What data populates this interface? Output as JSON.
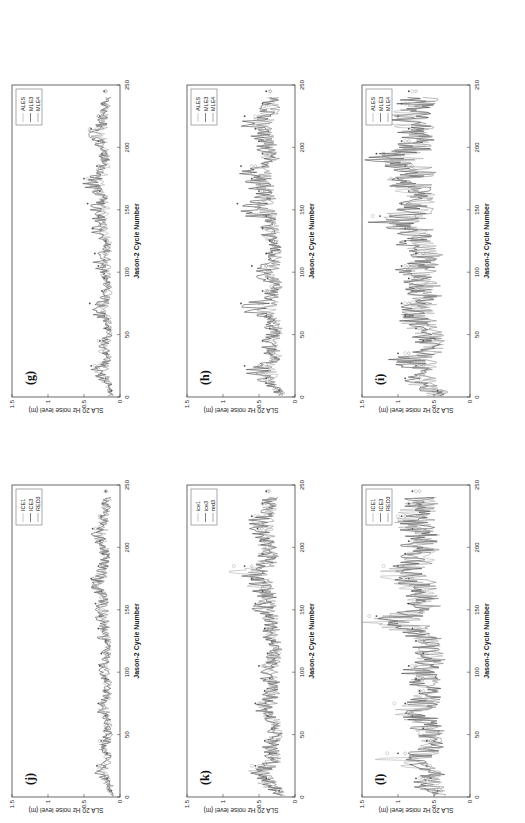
{
  "figure": {
    "ylabel": "SLA 20 Hz noise level (m)",
    "xlabel": "Jason-2 Cycle Number",
    "yticks": [
      "0",
      "0.5",
      "1",
      "1.5"
    ],
    "xticks": [
      "0",
      "50",
      "100",
      "150",
      "200",
      "250"
    ]
  },
  "chart_data": [
    {
      "type": "line",
      "panel": "(g)",
      "title": "(g)",
      "xlabel": "Jason-2 Cycle Number",
      "ylabel": "SLA 20 Hz noise level (m)",
      "xlim": [
        0,
        250
      ],
      "ylim": [
        0,
        1.5
      ],
      "legend_position": "upper right",
      "x": [
        0,
        10,
        20,
        30,
        40,
        50,
        60,
        70,
        80,
        90,
        100,
        110,
        120,
        130,
        140,
        150,
        160,
        170,
        180,
        190,
        200,
        210,
        220,
        230,
        240
      ],
      "series": [
        {
          "name": "ALES",
          "marker": "o",
          "values": [
            0.15,
            0.22,
            0.35,
            0.2,
            0.3,
            0.18,
            0.2,
            0.28,
            0.22,
            0.2,
            0.25,
            0.2,
            0.18,
            0.24,
            0.3,
            0.25,
            0.3,
            0.38,
            0.28,
            0.22,
            0.25,
            0.32,
            0.3,
            0.25,
            0.2
          ]
        },
        {
          "name": "MLE3",
          "marker": ".",
          "values": [
            0.12,
            0.2,
            0.4,
            0.18,
            0.28,
            0.2,
            0.22,
            0.42,
            0.25,
            0.22,
            0.3,
            0.35,
            0.2,
            0.38,
            0.3,
            0.45,
            0.28,
            0.5,
            0.32,
            0.25,
            0.3,
            0.4,
            0.28,
            0.25,
            0.22
          ]
        },
        {
          "name": "MLE4",
          "marker": "diamond",
          "values": [
            0.14,
            0.18,
            0.3,
            0.2,
            0.25,
            0.18,
            0.2,
            0.3,
            0.2,
            0.2,
            0.24,
            0.22,
            0.2,
            0.25,
            0.28,
            0.3,
            0.26,
            0.45,
            0.3,
            0.24,
            0.26,
            0.42,
            0.3,
            0.24,
            0.2
          ]
        }
      ]
    },
    {
      "type": "line",
      "panel": "(h)",
      "title": "(h)",
      "xlabel": "Jason-2 Cycle Number",
      "ylabel": "SLA 20 Hz noise level (m)",
      "xlim": [
        0,
        250
      ],
      "ylim": [
        0,
        1.5
      ],
      "legend_position": "upper right",
      "x": [
        0,
        10,
        20,
        30,
        40,
        50,
        60,
        70,
        80,
        90,
        100,
        110,
        120,
        130,
        140,
        150,
        160,
        170,
        180,
        190,
        200,
        210,
        220,
        230,
        240
      ],
      "series": [
        {
          "name": "ALES",
          "marker": "o",
          "values": [
            0.2,
            0.35,
            0.45,
            0.3,
            0.4,
            0.3,
            0.35,
            0.45,
            0.4,
            0.32,
            0.4,
            0.35,
            0.3,
            0.4,
            0.35,
            0.5,
            0.45,
            0.55,
            0.6,
            0.4,
            0.45,
            0.5,
            0.55,
            0.4,
            0.35
          ]
        },
        {
          "name": "MLE3",
          "marker": ".",
          "values": [
            0.22,
            0.4,
            0.7,
            0.35,
            0.45,
            0.35,
            0.4,
            0.75,
            0.45,
            0.38,
            0.6,
            0.4,
            0.35,
            0.45,
            0.4,
            0.8,
            0.5,
            0.6,
            0.75,
            0.45,
            0.5,
            0.55,
            0.7,
            0.45,
            0.4
          ]
        },
        {
          "name": "MLE4",
          "marker": "diamond",
          "values": [
            0.2,
            0.32,
            0.5,
            0.3,
            0.38,
            0.3,
            0.32,
            0.5,
            0.38,
            0.3,
            0.4,
            0.34,
            0.3,
            0.38,
            0.35,
            0.5,
            0.42,
            0.5,
            0.55,
            0.38,
            0.42,
            0.48,
            0.5,
            0.38,
            0.34
          ]
        }
      ]
    },
    {
      "type": "line",
      "panel": "(i)",
      "title": "(i)",
      "xlabel": "Jason-2 Cycle Number",
      "ylabel": "SLA 20 Hz noise level (m)",
      "xlim": [
        0,
        250
      ],
      "ylim": [
        0,
        1.5
      ],
      "legend_position": "upper right",
      "x": [
        0,
        10,
        20,
        30,
        40,
        50,
        60,
        70,
        80,
        90,
        100,
        110,
        120,
        130,
        140,
        150,
        160,
        170,
        180,
        190,
        200,
        210,
        220,
        230,
        240
      ],
      "series": [
        {
          "name": "ALES",
          "marker": "o",
          "values": [
            0.5,
            0.8,
            0.7,
            0.9,
            0.6,
            0.7,
            0.85,
            0.9,
            0.75,
            0.8,
            0.9,
            0.7,
            0.8,
            0.85,
            1.35,
            0.9,
            0.8,
            1.1,
            0.85,
            1.2,
            0.9,
            0.8,
            1.15,
            0.9,
            0.8
          ]
        },
        {
          "name": "MLE3",
          "marker": ".",
          "values": [
            0.45,
            0.9,
            0.75,
            1.0,
            0.65,
            0.75,
            0.9,
            0.95,
            0.8,
            0.85,
            0.95,
            0.75,
            0.9,
            0.9,
            1.25,
            0.95,
            0.85,
            1.0,
            0.9,
            1.3,
            0.95,
            0.85,
            1.0,
            0.95,
            0.85
          ]
        },
        {
          "name": "MLE4",
          "marker": "diamond",
          "values": [
            0.4,
            0.7,
            0.65,
            0.85,
            0.55,
            0.65,
            0.8,
            0.85,
            0.7,
            0.75,
            0.85,
            0.65,
            0.75,
            0.8,
            1.1,
            0.85,
            0.75,
            0.95,
            0.8,
            1.2,
            0.85,
            0.75,
            1.0,
            0.85,
            0.75
          ]
        }
      ]
    },
    {
      "type": "line",
      "panel": "(j)",
      "title": "(j)",
      "xlabel": "Jason-2 Cycle Number",
      "ylabel": "SLA 20 Hz noise level (m)",
      "xlim": [
        0,
        250
      ],
      "ylim": [
        0,
        1.5
      ],
      "legend_position": "upper right",
      "x": [
        0,
        10,
        20,
        30,
        40,
        50,
        60,
        70,
        80,
        90,
        100,
        110,
        120,
        130,
        140,
        150,
        160,
        170,
        180,
        190,
        200,
        210,
        220,
        230,
        240
      ],
      "series": [
        {
          "name": "ICE1",
          "marker": "o",
          "values": [
            0.15,
            0.2,
            0.3,
            0.2,
            0.28,
            0.2,
            0.2,
            0.26,
            0.22,
            0.2,
            0.24,
            0.2,
            0.18,
            0.22,
            0.28,
            0.24,
            0.3,
            0.36,
            0.28,
            0.22,
            0.26,
            0.3,
            0.28,
            0.24,
            0.2
          ]
        },
        {
          "name": "ICE3",
          "marker": ".",
          "values": [
            0.12,
            0.18,
            0.32,
            0.18,
            0.26,
            0.2,
            0.2,
            0.3,
            0.22,
            0.2,
            0.28,
            0.26,
            0.2,
            0.3,
            0.28,
            0.34,
            0.26,
            0.4,
            0.3,
            0.24,
            0.28,
            0.38,
            0.26,
            0.24,
            0.2
          ]
        },
        {
          "name": "RED3",
          "marker": "diamond",
          "values": [
            0.13,
            0.17,
            0.28,
            0.19,
            0.24,
            0.18,
            0.19,
            0.26,
            0.2,
            0.19,
            0.23,
            0.21,
            0.19,
            0.24,
            0.26,
            0.28,
            0.25,
            0.38,
            0.28,
            0.23,
            0.25,
            0.34,
            0.27,
            0.23,
            0.19
          ]
        }
      ]
    },
    {
      "type": "line",
      "panel": "(k)",
      "title": "(k)",
      "xlabel": "Jason-2 Cycle Number",
      "ylabel": "SLA 20 Hz noise level (m)",
      "xlim": [
        0,
        250
      ],
      "ylim": [
        0,
        1.5
      ],
      "legend_position": "upper right",
      "x": [
        0,
        10,
        20,
        30,
        40,
        50,
        60,
        70,
        80,
        90,
        100,
        110,
        120,
        130,
        140,
        150,
        160,
        170,
        180,
        190,
        200,
        210,
        220,
        230,
        240
      ],
      "series": [
        {
          "name": "ice1",
          "marker": "o",
          "values": [
            0.2,
            0.45,
            0.6,
            0.35,
            0.4,
            0.3,
            0.35,
            0.5,
            0.4,
            0.32,
            0.45,
            0.35,
            0.3,
            0.4,
            0.38,
            0.5,
            0.45,
            0.6,
            0.85,
            0.45,
            0.45,
            0.5,
            0.55,
            0.45,
            0.38
          ]
        },
        {
          "name": "ice3",
          "marker": ".",
          "values": [
            0.22,
            0.4,
            0.55,
            0.35,
            0.42,
            0.32,
            0.38,
            0.55,
            0.42,
            0.35,
            0.5,
            0.38,
            0.32,
            0.42,
            0.4,
            0.55,
            0.45,
            0.6,
            0.7,
            0.45,
            0.48,
            0.52,
            0.6,
            0.45,
            0.4
          ]
        },
        {
          "name": "red3",
          "marker": "diamond",
          "values": [
            0.2,
            0.35,
            0.5,
            0.32,
            0.38,
            0.3,
            0.34,
            0.48,
            0.38,
            0.32,
            0.42,
            0.34,
            0.3,
            0.38,
            0.36,
            0.48,
            0.42,
            0.52,
            0.6,
            0.4,
            0.42,
            0.46,
            0.5,
            0.4,
            0.36
          ]
        }
      ]
    },
    {
      "type": "line",
      "panel": "(l)",
      "title": "(l)",
      "xlabel": "Jason-2 Cycle Number",
      "ylabel": "SLA 20 Hz noise level (m)",
      "xlim": [
        0,
        250
      ],
      "ylim": [
        0,
        1.5
      ],
      "legend_position": "upper right",
      "x": [
        0,
        10,
        20,
        30,
        40,
        50,
        60,
        70,
        80,
        90,
        100,
        110,
        120,
        130,
        140,
        150,
        160,
        170,
        180,
        190,
        200,
        210,
        220,
        230,
        240
      ],
      "series": [
        {
          "name": "ICE1",
          "marker": "o",
          "values": [
            0.5,
            0.7,
            0.6,
            1.15,
            0.6,
            0.65,
            0.75,
            1.05,
            0.7,
            0.7,
            0.8,
            0.65,
            0.7,
            0.75,
            1.4,
            0.8,
            0.75,
            0.9,
            1.2,
            0.85,
            0.8,
            0.75,
            1.0,
            0.85,
            0.75
          ]
        },
        {
          "name": "ICE3",
          "marker": ".",
          "values": [
            0.45,
            0.75,
            0.6,
            1.0,
            0.6,
            0.65,
            0.8,
            0.9,
            0.7,
            0.75,
            0.85,
            0.65,
            0.75,
            0.8,
            1.3,
            0.85,
            0.8,
            0.85,
            1.0,
            0.9,
            0.85,
            0.8,
            0.95,
            0.85,
            0.8
          ]
        },
        {
          "name": "RED3",
          "marker": "diamond",
          "values": [
            0.4,
            0.65,
            0.55,
            0.9,
            0.55,
            0.6,
            0.7,
            0.85,
            0.65,
            0.65,
            0.75,
            0.6,
            0.65,
            0.7,
            1.1,
            0.75,
            0.7,
            0.8,
            0.95,
            0.8,
            0.75,
            0.7,
            0.9,
            0.75,
            0.7
          ]
        }
      ]
    }
  ],
  "colors": {
    "ALES": "#b8b8b8",
    "MLE3": "#555555",
    "MLE4": "#8a8a8a",
    "axis": "#333333"
  }
}
